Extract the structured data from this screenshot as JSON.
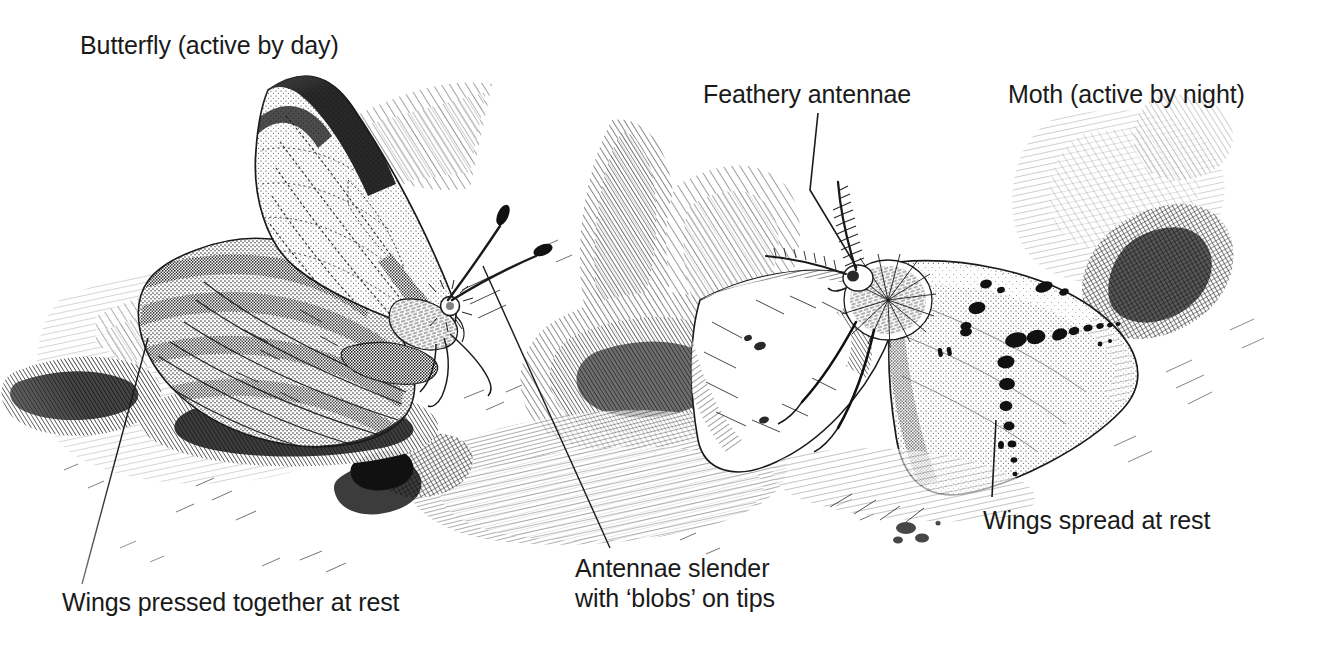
{
  "figure": {
    "medium": "pen-and-ink stipple illustration",
    "background_color": "#ffffff",
    "ink_color": "#1a1a1a"
  },
  "labels": {
    "butterfly": "Butterfly (active by day)",
    "feathery_antennae": "Feathery antennae",
    "moth": "Moth (active by night)",
    "wings_spread": "Wings spread at rest",
    "antennae_slender": "Antennae slender\nwith ‘blobs’ on tips",
    "wings_pressed": "Wings pressed together at rest"
  },
  "subjects": [
    {
      "name": "butterfly",
      "caption": "Butterfly (active by day)",
      "traits": [
        "Wings pressed together at rest",
        "Antennae slender with ‘blobs’ on tips"
      ]
    },
    {
      "name": "moth",
      "caption": "Moth (active by night)",
      "traits": [
        "Feathery antennae",
        "Wings spread at rest"
      ]
    }
  ],
  "leader_lines": [
    {
      "name": "feathery-antennae-leader",
      "from": [
        818,
        113
      ],
      "to": [
        857,
        268
      ]
    },
    {
      "name": "wings-spread-leader",
      "from": [
        996,
        420
      ],
      "to": [
        992,
        497
      ]
    },
    {
      "name": "antennae-slender-leader",
      "from": [
        483,
        266
      ],
      "to": [
        610,
        548
      ]
    },
    {
      "name": "wings-pressed-leader",
      "from": [
        148,
        338
      ],
      "to": [
        82,
        584
      ]
    }
  ]
}
